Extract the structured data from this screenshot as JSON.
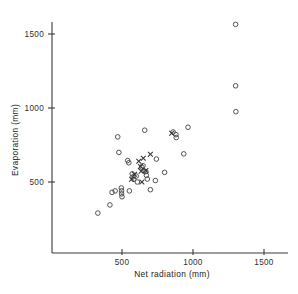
{
  "chart_data": {
    "type": "scatter",
    "title": "",
    "xlabel": "Net  radiation  (mm)",
    "ylabel": "Evaporation  (mm)",
    "xlim": [
      0,
      1600
    ],
    "ylim": [
      0,
      1640
    ],
    "grid": false,
    "legend": "none",
    "xticks": [
      500,
      1000,
      1500
    ],
    "xtick_labels": [
      "500",
      "1000",
      "1500"
    ],
    "yticks": [
      500,
      1000,
      1500
    ],
    "ytick_labels": [
      "500",
      "1000",
      "1500"
    ],
    "series": [
      {
        "name": "open-circle",
        "marker": "circle",
        "points": [
          [
            330,
            290
          ],
          [
            415,
            345
          ],
          [
            430,
            430
          ],
          [
            452,
            440
          ],
          [
            470,
            805
          ],
          [
            478,
            700
          ],
          [
            495,
            460
          ],
          [
            497,
            440
          ],
          [
            497,
            420
          ],
          [
            500,
            400
          ],
          [
            540,
            645
          ],
          [
            548,
            630
          ],
          [
            552,
            440
          ],
          [
            572,
            555
          ],
          [
            578,
            535
          ],
          [
            582,
            518
          ],
          [
            600,
            540
          ],
          [
            608,
            500
          ],
          [
            640,
            600
          ],
          [
            648,
            610
          ],
          [
            655,
            575
          ],
          [
            660,
            850
          ],
          [
            668,
            570
          ],
          [
            672,
            545
          ],
          [
            678,
            520
          ],
          [
            700,
            448
          ],
          [
            735,
            510
          ],
          [
            742,
            655
          ],
          [
            800,
            565
          ],
          [
            860,
            838
          ],
          [
            880,
            820
          ],
          [
            882,
            800
          ],
          [
            935,
            690
          ],
          [
            965,
            870
          ],
          [
            1300,
            1565
          ],
          [
            1300,
            1150
          ],
          [
            1302,
            975
          ]
        ]
      },
      {
        "name": "cross",
        "marker": "x",
        "points": [
          [
            568,
            518
          ],
          [
            588,
            552
          ],
          [
            618,
            640
          ],
          [
            630,
            605
          ],
          [
            635,
            572
          ],
          [
            640,
            500
          ],
          [
            650,
            660
          ],
          [
            668,
            578
          ],
          [
            700,
            688
          ],
          [
            850,
            830
          ]
        ]
      }
    ]
  }
}
